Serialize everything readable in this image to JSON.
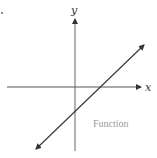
{
  "diagram": {
    "type": "coordinate-plane",
    "labels": {
      "x_axis": "x",
      "y_axis": "y",
      "caption": "Function"
    },
    "colors": {
      "axes": "#555555",
      "line": "#3a3a3a",
      "axis_label": "#333333",
      "caption": "#9a9a9a",
      "background": "#ffffff"
    },
    "geometry": {
      "origin_px": [
        75,
        87
      ],
      "x_axis_px": {
        "start": [
          7,
          87
        ],
        "end": [
          141,
          87
        ],
        "arrow": "end"
      },
      "y_axis_px": {
        "start": [
          75,
          151
        ],
        "end": [
          75,
          19
        ],
        "arrow": "end"
      },
      "function_line_px": {
        "start": [
          36,
          149
        ],
        "end": [
          144,
          45
        ],
        "arrows": "both"
      },
      "x_intercept_px": [
        104,
        87
      ],
      "y_intercept_px": [
        75,
        115
      ]
    },
    "function": {
      "kind": "linear",
      "slope_sign": "positive",
      "x_intercept_sign": "positive",
      "y_intercept_sign": "negative"
    }
  }
}
